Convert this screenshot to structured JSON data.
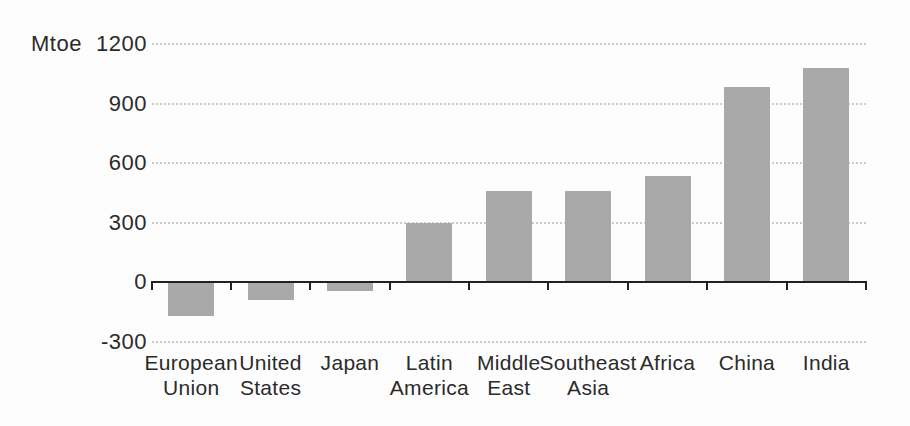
{
  "chart_data": {
    "type": "bar",
    "title": "",
    "xlabel": "",
    "ylabel": "Mtoe",
    "unit_label": "Mtoe",
    "categories": [
      "European Union",
      "United States",
      "Japan",
      "Latin America",
      "Middle East",
      "Southeast Asia",
      "Africa",
      "China",
      "India"
    ],
    "category_lines": [
      [
        "European",
        "Union"
      ],
      [
        "United",
        "States"
      ],
      [
        "Japan"
      ],
      [
        "Latin",
        "America"
      ],
      [
        "Middle",
        "East"
      ],
      [
        "Southeast",
        "Asia"
      ],
      [
        "Africa"
      ],
      [
        "China"
      ],
      [
        "India"
      ]
    ],
    "values": [
      -170,
      -90,
      -45,
      300,
      460,
      460,
      535,
      985,
      1080
    ],
    "ylim": [
      -300,
      1200
    ],
    "yticks": [
      1200,
      900,
      600,
      300,
      0,
      -300
    ],
    "gridlines": [
      1200,
      900,
      600,
      300,
      -300
    ],
    "grid": "horizontal-dotted",
    "legend": "none",
    "bar_color": "#a9a9a9",
    "axis_color": "#212121",
    "grid_color": "#cbcbcb",
    "text_color": "#2b2b2b",
    "background_color": "#fdfdfd"
  }
}
